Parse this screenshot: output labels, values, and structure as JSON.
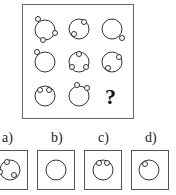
{
  "puzzle": {
    "question_mark": "?",
    "grid": [
      {
        "row": 1,
        "col": 1,
        "dots": [
          "top-left",
          "right",
          "bottom"
        ]
      },
      {
        "row": 1,
        "col": 2,
        "dots": [
          "top-right",
          "left-bottom"
        ]
      },
      {
        "row": 1,
        "col": 3,
        "dots": [
          "bottom-right"
        ]
      },
      {
        "row": 2,
        "col": 1,
        "dots": [
          "top-left"
        ]
      },
      {
        "row": 2,
        "col": 2,
        "dots": [
          "top",
          "bottom-left",
          "bottom-right"
        ]
      },
      {
        "row": 2,
        "col": 3,
        "dots": [
          "top-right",
          "bottom-left"
        ]
      },
      {
        "row": 3,
        "col": 1,
        "dots": [
          "top-left-inner",
          "top-right-inner"
        ]
      },
      {
        "row": 3,
        "col": 2,
        "dots": [
          "top-left",
          "top-right"
        ]
      },
      {
        "row": 3,
        "col": 3,
        "dots": [
          "?"
        ]
      }
    ]
  },
  "options": [
    {
      "label": "a)",
      "dots": [
        "top",
        "left",
        "bottom-right"
      ]
    },
    {
      "label": "b)",
      "dots": []
    },
    {
      "label": "c)",
      "dots": [
        "top-left-inner",
        "top-right-inner"
      ]
    },
    {
      "label": "d)",
      "dots": [
        "top-left-inner"
      ]
    }
  ]
}
